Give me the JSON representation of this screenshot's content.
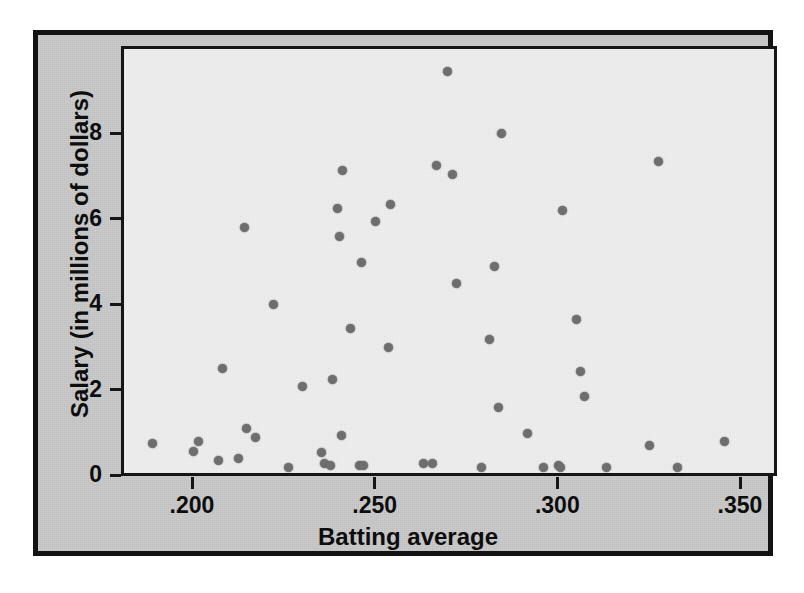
{
  "chart_data": {
    "type": "scatter",
    "title": "",
    "xlabel": "Batting average",
    "ylabel": "Salary (in millions of dollars)",
    "xlim": [
      0.1825,
      0.3525
    ],
    "ylim": [
      0,
      9.9
    ],
    "xticks": [
      0.2,
      0.25,
      0.3,
      0.35
    ],
    "xticklabels": [
      ".200",
      ".250",
      ".300",
      ".350"
    ],
    "yticks": [
      0,
      2,
      4,
      6,
      8
    ],
    "yticklabels": [
      "0",
      "2",
      "4",
      "6",
      "8"
    ],
    "grid": false,
    "legend": null,
    "marker": {
      "shape": "circle",
      "color": "#6e6e6e",
      "size": 9
    },
    "series": [
      {
        "name": "Players",
        "points": [
          {
            "x": 0.1885,
            "y": 0.8
          },
          {
            "x": 0.1995,
            "y": 0.63
          },
          {
            "x": 0.201,
            "y": 0.85
          },
          {
            "x": 0.2065,
            "y": 0.4
          },
          {
            "x": 0.2075,
            "y": 2.55
          },
          {
            "x": 0.212,
            "y": 0.45
          },
          {
            "x": 0.2135,
            "y": 5.85
          },
          {
            "x": 0.214,
            "y": 1.15
          },
          {
            "x": 0.2165,
            "y": 0.95
          },
          {
            "x": 0.2215,
            "y": 4.05
          },
          {
            "x": 0.2255,
            "y": 0.25
          },
          {
            "x": 0.2295,
            "y": 2.15
          },
          {
            "x": 0.2345,
            "y": 0.6
          },
          {
            "x": 0.2355,
            "y": 0.35
          },
          {
            "x": 0.237,
            "y": 0.3
          },
          {
            "x": 0.2375,
            "y": 2.3
          },
          {
            "x": 0.239,
            "y": 6.3
          },
          {
            "x": 0.2395,
            "y": 5.65
          },
          {
            "x": 0.24,
            "y": 1.0
          },
          {
            "x": 0.2405,
            "y": 7.2
          },
          {
            "x": 0.2425,
            "y": 3.5
          },
          {
            "x": 0.245,
            "y": 0.3
          },
          {
            "x": 0.2455,
            "y": 5.05
          },
          {
            "x": 0.246,
            "y": 0.3
          },
          {
            "x": 0.2495,
            "y": 6.0
          },
          {
            "x": 0.253,
            "y": 3.05
          },
          {
            "x": 0.2535,
            "y": 6.4
          },
          {
            "x": 0.2625,
            "y": 0.35
          },
          {
            "x": 0.265,
            "y": 0.35
          },
          {
            "x": 0.266,
            "y": 7.3
          },
          {
            "x": 0.269,
            "y": 9.5
          },
          {
            "x": 0.2705,
            "y": 7.1
          },
          {
            "x": 0.2715,
            "y": 4.55
          },
          {
            "x": 0.2785,
            "y": 0.25
          },
          {
            "x": 0.2805,
            "y": 3.25
          },
          {
            "x": 0.282,
            "y": 4.95
          },
          {
            "x": 0.283,
            "y": 1.65
          },
          {
            "x": 0.284,
            "y": 8.05
          },
          {
            "x": 0.291,
            "y": 1.05
          },
          {
            "x": 0.2955,
            "y": 0.25
          },
          {
            "x": 0.2995,
            "y": 0.3
          },
          {
            "x": 0.3,
            "y": 0.25
          },
          {
            "x": 0.3005,
            "y": 6.25
          },
          {
            "x": 0.3045,
            "y": 3.7
          },
          {
            "x": 0.3055,
            "y": 2.5
          },
          {
            "x": 0.3065,
            "y": 1.9
          },
          {
            "x": 0.3125,
            "y": 0.25
          },
          {
            "x": 0.3245,
            "y": 0.75
          },
          {
            "x": 0.327,
            "y": 7.4
          },
          {
            "x": 0.332,
            "y": 0.25
          },
          {
            "x": 0.345,
            "y": 0.85
          }
        ]
      }
    ]
  },
  "colors": {
    "mat": "#c9c9c9",
    "plot_background": "#eeeeee",
    "frame": "#131313",
    "marker": "#6e6e6e",
    "text": "#0d0d0d"
  }
}
